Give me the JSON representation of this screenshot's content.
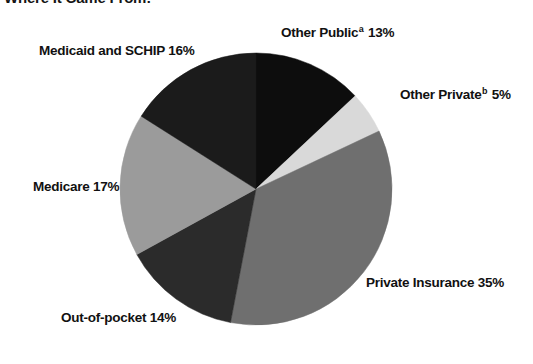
{
  "chart_data": {
    "type": "pie",
    "title": "Where It Came From:",
    "subtitle": "",
    "xlabel": "",
    "ylabel": "",
    "legend_position": "none",
    "grid": false,
    "units": "percent",
    "total": 100,
    "start_angle_deg": 0,
    "direction": "clockwise",
    "categories": [
      "Other Public",
      "Other Private",
      "Private Insurance",
      "Out-of-pocket",
      "Medicare",
      "Medicaid and SCHIP"
    ],
    "values": [
      13,
      5,
      35,
      14,
      17,
      16
    ],
    "slices": [
      {
        "name": "other-public",
        "category": "Other Public",
        "value": 13,
        "value_text": "13%",
        "label": "Other Public",
        "label_full": "Other Publicᵃ 13%",
        "footnote_marker": "a",
        "color": "#0d0d0d",
        "start_deg": 0,
        "end_deg": 46.8
      },
      {
        "name": "other-private",
        "category": "Other Private",
        "value": 5,
        "value_text": "5%",
        "label": "Other Private",
        "label_full": "Other Privateᵇ 5%",
        "footnote_marker": "b",
        "color": "#d9d9d9",
        "start_deg": 46.8,
        "end_deg": 64.8
      },
      {
        "name": "private-insurance",
        "category": "Private Insurance",
        "value": 35,
        "value_text": "35%",
        "label": "Private Insurance",
        "label_full": "Private Insurance 35%",
        "footnote_marker": "",
        "color": "#6f6f6f",
        "start_deg": 64.8,
        "end_deg": 190.8
      },
      {
        "name": "out-of-pocket",
        "category": "Out-of-pocket",
        "value": 14,
        "value_text": "14%",
        "label": "Out-of-pocket",
        "label_full": "Out-of-pocket 14%",
        "footnote_marker": "",
        "color": "#2b2b2b",
        "start_deg": 190.8,
        "end_deg": 241.2
      },
      {
        "name": "medicare",
        "category": "Medicare",
        "value": 17,
        "value_text": "17%",
        "label": "Medicare",
        "label_full": "Medicare 17%",
        "footnote_marker": "",
        "color": "#9b9b9b",
        "start_deg": 241.2,
        "end_deg": 302.4
      },
      {
        "name": "medicaid-schip",
        "category": "Medicaid and SCHIP",
        "value": 16,
        "value_text": "16%",
        "label": "Medicaid and SCHIP",
        "label_full": "Medicaid and SCHIP 16%",
        "footnote_marker": "",
        "color": "#1b1b1b",
        "start_deg": 302.4,
        "end_deg": 360
      }
    ],
    "geometry": {
      "center_x": 256,
      "center_y": 189,
      "radius": 136
    },
    "colors": {
      "background": "#ffffff",
      "text": "#111111"
    }
  },
  "labels": {
    "other_public": {
      "text": "Other Public",
      "marker": "a",
      "value": " 13%"
    },
    "other_private": {
      "text": "Other Private",
      "marker": "b",
      "value": " 5%"
    },
    "private_ins": {
      "text": "Private Insurance ",
      "marker": "",
      "value": "35%"
    },
    "out_of_pocket": {
      "text": "Out-of-pocket ",
      "marker": "",
      "value": "14%"
    },
    "medicare": {
      "text": "Medicare ",
      "marker": "",
      "value": "17%"
    },
    "medicaid": {
      "text": "Medicaid and SCHIP ",
      "marker": "",
      "value": "16%"
    }
  },
  "header": {
    "title": "Where It Came From:"
  }
}
